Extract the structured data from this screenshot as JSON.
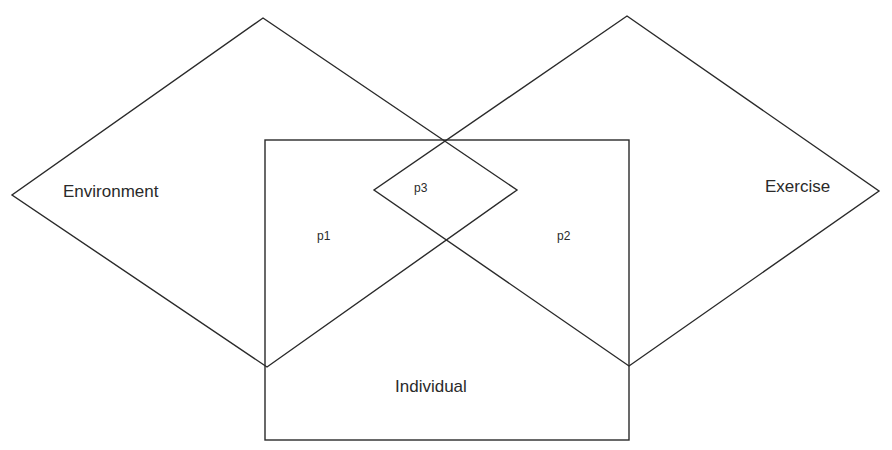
{
  "diagram": {
    "type": "overlapping-sets",
    "sets": [
      {
        "id": "environment",
        "label": "Environment",
        "shape": "diamond"
      },
      {
        "id": "exercise",
        "label": "Exercise",
        "shape": "diamond"
      },
      {
        "id": "individual",
        "label": "Individual",
        "shape": "rectangle"
      }
    ],
    "regions": [
      {
        "id": "p1",
        "label": "p1",
        "sets": [
          "environment",
          "individual"
        ]
      },
      {
        "id": "p2",
        "label": "p2",
        "sets": [
          "exercise",
          "individual"
        ]
      },
      {
        "id": "p3",
        "label": "p3",
        "sets": [
          "environment",
          "exercise",
          "individual"
        ]
      }
    ],
    "line_color": "#2a2a2a",
    "background": "#ffffff"
  }
}
